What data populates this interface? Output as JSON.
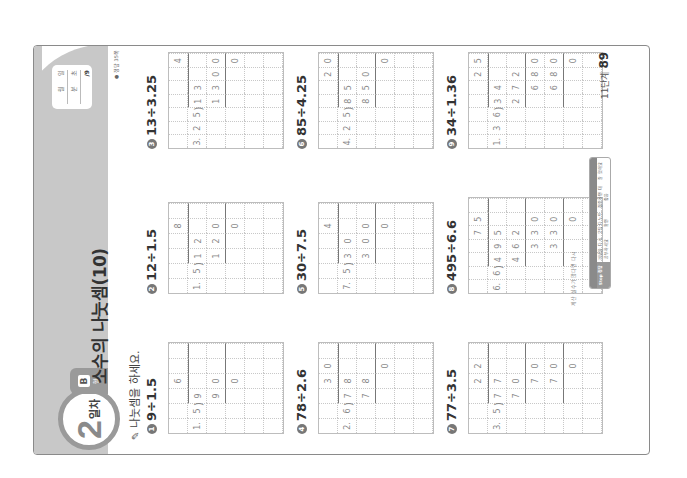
{
  "header": {
    "day_number": "2",
    "day_label": "일차",
    "type_letter": "B",
    "type_suffix": "형",
    "title": "소수의 나눗셈(10)",
    "record": {
      "date_fields": [
        "월",
        "일"
      ],
      "time_fields": [
        "분",
        "초"
      ],
      "score": "/9"
    },
    "answer_ref": "● 정답 35쪽"
  },
  "instruction": {
    "icon": "pencil-icon",
    "text": "나눗셈을 하세요."
  },
  "problems": [
    {
      "num": "1",
      "expression": "9÷1.5",
      "cols": 6,
      "rows": 6,
      "cells": [
        [
          "",
          "",
          "",
          "6",
          "",
          ""
        ],
        [
          "1.",
          "5",
          "9",
          "",
          "",
          ""
        ],
        [
          "",
          "",
          "9",
          "0",
          "",
          ""
        ],
        [
          "",
          "",
          "",
          "0",
          "",
          ""
        ],
        [
          "",
          "",
          "",
          "",
          "",
          ""
        ],
        [
          "",
          "",
          "",
          "",
          "",
          ""
        ]
      ],
      "quotient_col_start": 2,
      "sub_rows": [
        2
      ]
    },
    {
      "num": "2",
      "expression": "12÷1.5",
      "cols": 6,
      "rows": 6,
      "cells": [
        [
          "",
          "",
          "",
          "",
          "8",
          ""
        ],
        [
          "1.",
          "5",
          "1",
          "2",
          "",
          ""
        ],
        [
          "",
          "",
          "1",
          "2",
          "0",
          ""
        ],
        [
          "",
          "",
          "",
          "",
          "0",
          ""
        ],
        [
          "",
          "",
          "",
          "",
          "",
          ""
        ],
        [
          "",
          "",
          "",
          "",
          "",
          ""
        ]
      ],
      "quotient_col_start": 2,
      "sub_rows": [
        2
      ]
    },
    {
      "num": "3",
      "expression": "13÷3.25",
      "cols": 7,
      "rows": 6,
      "cells": [
        [
          "",
          "",
          "",
          "",
          "",
          "",
          "4"
        ],
        [
          "3.",
          "2",
          "5",
          "1",
          "3",
          "",
          ""
        ],
        [
          "",
          "",
          "",
          "1",
          "3",
          "0",
          "0"
        ],
        [
          "",
          "",
          "",
          "",
          "",
          "",
          "0"
        ],
        [
          "",
          "",
          "",
          "",
          "",
          "",
          ""
        ],
        [
          "",
          "",
          "",
          "",
          "",
          "",
          ""
        ]
      ],
      "quotient_col_start": 3,
      "sub_rows": [
        2
      ]
    },
    {
      "num": "4",
      "expression": "78÷2.6",
      "cols": 6,
      "rows": 6,
      "cells": [
        [
          "",
          "",
          "",
          "3",
          "0",
          ""
        ],
        [
          "2.",
          "6",
          "7",
          "8",
          "",
          ""
        ],
        [
          "",
          "",
          "7",
          "8",
          "",
          ""
        ],
        [
          "",
          "",
          "",
          "",
          "0",
          ""
        ],
        [
          "",
          "",
          "",
          "",
          "",
          ""
        ],
        [
          "",
          "",
          "",
          "",
          "",
          ""
        ]
      ],
      "quotient_col_start": 2,
      "sub_rows": [
        2
      ]
    },
    {
      "num": "5",
      "expression": "30÷7.5",
      "cols": 6,
      "rows": 6,
      "cells": [
        [
          "",
          "",
          "",
          "",
          "4",
          ""
        ],
        [
          "7.",
          "5",
          "3",
          "0",
          "",
          ""
        ],
        [
          "",
          "",
          "3",
          "0",
          "0",
          ""
        ],
        [
          "",
          "",
          "",
          "",
          "0",
          ""
        ],
        [
          "",
          "",
          "",
          "",
          "",
          ""
        ],
        [
          "",
          "",
          "",
          "",
          "",
          ""
        ]
      ],
      "quotient_col_start": 2,
      "sub_rows": [
        2
      ]
    },
    {
      "num": "6",
      "expression": "85÷4.25",
      "cols": 7,
      "rows": 6,
      "cells": [
        [
          "",
          "",
          "",
          "",
          "",
          "2",
          "0"
        ],
        [
          "4.",
          "2",
          "5",
          "8",
          "5",
          "",
          ""
        ],
        [
          "",
          "",
          "",
          "8",
          "5",
          "0",
          ""
        ],
        [
          "",
          "",
          "",
          "",
          "",
          "",
          "0"
        ],
        [
          "",
          "",
          "",
          "",
          "",
          "",
          ""
        ],
        [
          "",
          "",
          "",
          "",
          "",
          "",
          ""
        ]
      ],
      "quotient_col_start": 3,
      "sub_rows": [
        2
      ]
    },
    {
      "num": "7",
      "expression": "77÷3.5",
      "cols": 6,
      "rows": 7,
      "cells": [
        [
          "",
          "",
          "",
          "2",
          "2",
          ""
        ],
        [
          "3.",
          "5",
          "7",
          "7",
          "",
          ""
        ],
        [
          "",
          "",
          "7",
          "0",
          "",
          ""
        ],
        [
          "",
          "",
          "",
          "7",
          "0",
          ""
        ],
        [
          "",
          "",
          "",
          "7",
          "0",
          ""
        ],
        [
          "",
          "",
          "",
          "",
          "0",
          ""
        ],
        [
          "",
          "",
          "",
          "",
          "",
          ""
        ]
      ],
      "quotient_col_start": 2,
      "sub_rows": [
        2,
        4
      ]
    },
    {
      "num": "8",
      "expression": "495÷6.6",
      "cols": 7,
      "rows": 7,
      "cells": [
        [
          "",
          "",
          "",
          "",
          "7",
          "5",
          ""
        ],
        [
          "6.",
          "6",
          "4",
          "9",
          "5",
          "",
          ""
        ],
        [
          "",
          "",
          "4",
          "6",
          "2",
          "",
          ""
        ],
        [
          "",
          "",
          "",
          "3",
          "3",
          "0",
          ""
        ],
        [
          "",
          "",
          "",
          "3",
          "3",
          "0",
          ""
        ],
        [
          "",
          "",
          "",
          "",
          "",
          "0",
          ""
        ],
        [
          "",
          "",
          "",
          "",
          "",
          "",
          ""
        ]
      ],
      "quotient_col_start": 2,
      "sub_rows": [
        2,
        4
      ]
    },
    {
      "num": "9",
      "expression": "34÷1.36",
      "cols": 7,
      "rows": 7,
      "cells": [
        [
          "",
          "",
          "",
          "",
          "",
          "2",
          "5"
        ],
        [
          "1.",
          "3",
          "6",
          "3",
          "4",
          "",
          ""
        ],
        [
          "",
          "",
          "",
          "2",
          "7",
          "2",
          ""
        ],
        [
          "",
          "",
          "",
          "",
          "6",
          "8",
          "0"
        ],
        [
          "",
          "",
          "",
          "",
          "6",
          "8",
          "0"
        ],
        [
          "",
          "",
          "",
          "",
          "",
          "",
          "0"
        ],
        [
          "",
          "",
          "",
          "",
          "",
          "",
          ""
        ]
      ],
      "quotient_col_start": 3,
      "sub_rows": [
        2,
        4
      ]
    }
  ],
  "footer": {
    "note": "계산 실수가 많다면 다시",
    "table": [
      {
        "header": "",
        "body": "Stop 정답"
      },
      {
        "header": "",
        "body": "개념을 다시 공부하세요"
      },
      {
        "header": "",
        "body": "오답 다 노트 확인"
      },
      {
        "header": "",
        "body": "집중하면 더 좋음"
      },
      {
        "header": "",
        "body": "잘 했어요"
      }
    ],
    "stage_label": "11단계",
    "page_number": "89"
  }
}
